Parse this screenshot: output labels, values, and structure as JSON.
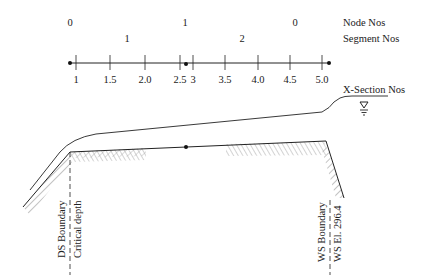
{
  "colors": {
    "ink": "#222222",
    "hatch": "#9a9a9a",
    "background": "#ffffff"
  },
  "legend": {
    "node_label": "Node Nos",
    "segment_label": "Segment Nos",
    "xsection_label": "X-Section Nos"
  },
  "nodes": [
    {
      "label": "0",
      "x": 70
    },
    {
      "label": "1",
      "x": 185
    },
    {
      "label": "0",
      "x": 295
    }
  ],
  "segments": [
    {
      "label": "1",
      "x": 127
    },
    {
      "label": "2",
      "x": 242
    }
  ],
  "xsections": [
    {
      "label": "1",
      "x": 76
    },
    {
      "label": "1.5",
      "x": 110
    },
    {
      "label": "2.0",
      "x": 145
    },
    {
      "label": "2.5",
      "x": 180
    },
    {
      "label": "3",
      "x": 193
    },
    {
      "label": "3.5",
      "x": 225
    },
    {
      "label": "4.0",
      "x": 258
    },
    {
      "label": "4.5",
      "x": 290
    },
    {
      "label": "5.0",
      "x": 322
    }
  ],
  "water_surface_icon": "water-level-triangle",
  "boundaries": {
    "ds_boundary": "DS Boundary",
    "ds_condition": "Critical depth",
    "ws_boundary": "WS Boundary",
    "ws_condition": "WS El. 296.4"
  }
}
